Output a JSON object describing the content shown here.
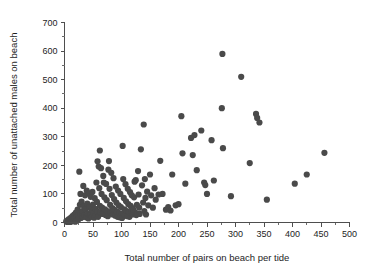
{
  "chart_data": {
    "type": "scatter",
    "title": "",
    "xlabel": "Total number of pairs on beach per tide",
    "ylabel": "Total number of unattached males on beach",
    "xlim": [
      0,
      500
    ],
    "ylim": [
      0,
      700
    ],
    "xticks": [
      0,
      50,
      100,
      150,
      200,
      250,
      300,
      350,
      400,
      450,
      500
    ],
    "yticks": [
      0,
      100,
      200,
      300,
      400,
      500,
      600,
      700
    ],
    "xtick_labels": [
      "0",
      "50",
      "100",
      "150",
      "200",
      "250",
      "300",
      "350",
      "400",
      "450",
      "500"
    ],
    "ytick_labels": [
      "0",
      "100",
      "200",
      "300",
      "400",
      "500",
      "600",
      "700"
    ],
    "x_minor_step": 25,
    "y_minor_step": 50,
    "grid": false,
    "legend": null,
    "marker": {
      "shape": "circle",
      "color": "#4a4a4a",
      "size_px": 6.2,
      "opacity": 1.0
    },
    "n_points": 182,
    "points": [
      [
        3,
        4
      ],
      [
        5,
        2
      ],
      [
        6,
        8
      ],
      [
        7,
        3
      ],
      [
        8,
        12
      ],
      [
        9,
        6
      ],
      [
        10,
        2
      ],
      [
        11,
        16
      ],
      [
        12,
        9
      ],
      [
        13,
        4
      ],
      [
        14,
        22
      ],
      [
        15,
        11
      ],
      [
        16,
        6
      ],
      [
        17,
        28
      ],
      [
        18,
        14
      ],
      [
        19,
        3
      ],
      [
        20,
        35
      ],
      [
        21,
        18
      ],
      [
        22,
        9
      ],
      [
        23,
        45
      ],
      [
        24,
        24
      ],
      [
        25,
        12
      ],
      [
        26,
        178
      ],
      [
        27,
        62
      ],
      [
        28,
        31
      ],
      [
        28,
        100
      ],
      [
        29,
        16
      ],
      [
        30,
        73
      ],
      [
        31,
        40
      ],
      [
        32,
        20
      ],
      [
        33,
        128
      ],
      [
        34,
        58
      ],
      [
        35,
        26
      ],
      [
        36,
        95
      ],
      [
        37,
        47
      ],
      [
        38,
        18
      ],
      [
        39,
        112
      ],
      [
        40,
        66
      ],
      [
        41,
        30
      ],
      [
        42,
        14
      ],
      [
        43,
        102
      ],
      [
        44,
        54
      ],
      [
        45,
        25
      ],
      [
        46,
        90
      ],
      [
        47,
        44
      ],
      [
        48,
        20
      ],
      [
        49,
        107
      ],
      [
        50,
        63
      ],
      [
        51,
        33
      ],
      [
        52,
        17
      ],
      [
        53,
        85
      ],
      [
        54,
        48
      ],
      [
        55,
        27
      ],
      [
        56,
        140
      ],
      [
        57,
        72
      ],
      [
        58,
        38
      ],
      [
        58,
        214
      ],
      [
        59,
        20
      ],
      [
        60,
        196
      ],
      [
        61,
        120
      ],
      [
        62,
        58
      ],
      [
        62,
        252
      ],
      [
        63,
        35
      ],
      [
        64,
        190
      ],
      [
        65,
        100
      ],
      [
        66,
        52
      ],
      [
        67,
        30
      ],
      [
        68,
        163
      ],
      [
        69,
        140
      ],
      [
        70,
        88
      ],
      [
        71,
        46
      ],
      [
        72,
        26
      ],
      [
        73,
        135
      ],
      [
        74,
        78
      ],
      [
        75,
        40
      ],
      [
        76,
        22
      ],
      [
        77,
        185
      ],
      [
        78,
        215
      ],
      [
        79,
        118
      ],
      [
        80,
        62
      ],
      [
        81,
        34
      ],
      [
        82,
        174
      ],
      [
        83,
        96
      ],
      [
        84,
        50
      ],
      [
        85,
        28
      ],
      [
        86,
        155
      ],
      [
        87,
        82
      ],
      [
        88,
        44
      ],
      [
        89,
        24
      ],
      [
        90,
        126
      ],
      [
        91,
        70
      ],
      [
        92,
        38
      ],
      [
        93,
        20
      ],
      [
        94,
        112
      ],
      [
        95,
        60
      ],
      [
        96,
        33
      ],
      [
        97,
        18
      ],
      [
        98,
        100
      ],
      [
        99,
        54
      ],
      [
        100,
        30
      ],
      [
        101,
        16
      ],
      [
        102,
        268
      ],
      [
        103,
        152
      ],
      [
        104,
        86
      ],
      [
        105,
        46
      ],
      [
        106,
        26
      ],
      [
        107,
        134
      ],
      [
        108,
        74
      ],
      [
        109,
        40
      ],
      [
        110,
        22
      ],
      [
        111,
        118
      ],
      [
        112,
        64
      ],
      [
        113,
        36
      ],
      [
        114,
        20
      ],
      [
        115,
        106
      ],
      [
        116,
        58
      ],
      [
        117,
        32
      ],
      [
        118,
        95
      ],
      [
        119,
        50
      ],
      [
        120,
        28
      ],
      [
        121,
        44
      ],
      [
        122,
        88
      ],
      [
        123,
        143
      ],
      [
        124,
        35
      ],
      [
        125,
        148
      ],
      [
        126,
        26
      ],
      [
        127,
        62
      ],
      [
        128,
        30
      ],
      [
        129,
        180
      ],
      [
        130,
        98
      ],
      [
        131,
        52
      ],
      [
        132,
        30
      ],
      [
        134,
        256
      ],
      [
        136,
        130
      ],
      [
        138,
        70
      ],
      [
        139,
        343
      ],
      [
        140,
        40
      ],
      [
        141,
        152
      ],
      [
        142,
        86
      ],
      [
        143,
        28
      ],
      [
        145,
        108
      ],
      [
        147,
        60
      ],
      [
        150,
        168
      ],
      [
        152,
        95
      ],
      [
        155,
        52
      ],
      [
        158,
        120
      ],
      [
        160,
        80
      ],
      [
        165,
        98
      ],
      [
        168,
        216
      ],
      [
        172,
        100
      ],
      [
        178,
        45
      ],
      [
        182,
        54
      ],
      [
        186,
        42
      ],
      [
        189,
        168
      ],
      [
        195,
        60
      ],
      [
        200,
        64
      ],
      [
        205,
        372
      ],
      [
        207,
        242
      ],
      [
        212,
        136
      ],
      [
        222,
        296
      ],
      [
        225,
        236
      ],
      [
        228,
        306
      ],
      [
        232,
        183
      ],
      [
        240,
        322
      ],
      [
        245,
        140
      ],
      [
        247,
        131
      ],
      [
        250,
        100
      ],
      [
        258,
        288
      ],
      [
        262,
        147
      ],
      [
        276,
        400
      ],
      [
        277,
        590
      ],
      [
        278,
        260
      ],
      [
        292,
        92
      ],
      [
        310,
        510
      ],
      [
        325,
        208
      ],
      [
        336,
        380
      ],
      [
        338,
        366
      ],
      [
        342,
        350
      ],
      [
        355,
        80
      ],
      [
        404,
        136
      ],
      [
        425,
        168
      ],
      [
        456,
        244
      ]
    ]
  },
  "axes": {
    "x_axis_name": "x-axis",
    "y_axis_name": "y-axis"
  }
}
